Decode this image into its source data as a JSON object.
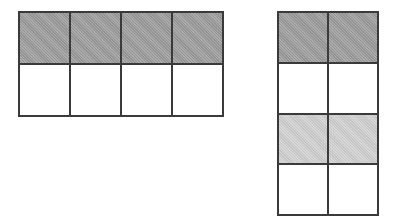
{
  "figure": {
    "background_color": "#ffffff",
    "line_color": "#3a3a3a",
    "shade_colors": {
      "white": "#ffffff",
      "dark_gray": "#9a9a9a",
      "light_gray": "#cfcfcf"
    }
  },
  "grids": [
    {
      "id": "left-grid",
      "label": "Left grid",
      "columns": 4,
      "rows": 2,
      "total_cells": 8,
      "shaded_cells": 4,
      "x": 18,
      "y": 11,
      "width": 206,
      "height": 106,
      "cells": [
        [
          {
            "shade": "dark_gray"
          },
          {
            "shade": "dark_gray"
          },
          {
            "shade": "dark_gray"
          },
          {
            "shade": "dark_gray"
          }
        ],
        [
          {
            "shade": "white"
          },
          {
            "shade": "white"
          },
          {
            "shade": "white"
          },
          {
            "shade": "white"
          }
        ]
      ]
    },
    {
      "id": "right-grid",
      "label": "Right grid",
      "columns": 2,
      "rows": 4,
      "total_cells": 8,
      "shaded_cells": 4,
      "x": 277,
      "y": 11,
      "width": 102,
      "height": 205,
      "cells": [
        [
          {
            "shade": "dark_gray"
          },
          {
            "shade": "dark_gray"
          }
        ],
        [
          {
            "shade": "white"
          },
          {
            "shade": "white"
          }
        ],
        [
          {
            "shade": "light_gray"
          },
          {
            "shade": "light_gray"
          }
        ],
        [
          {
            "shade": "white"
          },
          {
            "shade": "white"
          }
        ]
      ]
    }
  ]
}
